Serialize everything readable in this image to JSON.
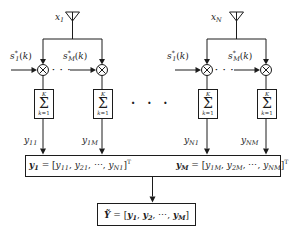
{
  "palette": {
    "ink": "#1c1c1c",
    "paper": "#ffffff"
  },
  "icons": {
    "antenna": "triangle-on-pole",
    "multiplier": "circled-times ⊗",
    "summation": "Σ block"
  },
  "ellipsis": {
    "dots": "···"
  },
  "labels": {
    "x1": [
      {
        "t": "x",
        "f": "i"
      },
      {
        "t": "1",
        "pos": "s",
        "f": "i"
      }
    ],
    "xN": [
      {
        "t": "x",
        "f": "i"
      },
      {
        "t": "N",
        "pos": "s",
        "f": "i"
      }
    ],
    "s1": [
      {
        "t": "s",
        "f": "i"
      },
      {
        "t": "*",
        "pos": "u",
        "f": "n"
      },
      {
        "t": "1",
        "pos": "s",
        "f": "i"
      },
      {
        "t": "(",
        "f": "n"
      },
      {
        "t": "k",
        "f": "i"
      },
      {
        "t": ")",
        "f": "n"
      }
    ],
    "sM": [
      {
        "t": "s",
        "f": "i"
      },
      {
        "t": "*",
        "pos": "u",
        "f": "n"
      },
      {
        "t": "M",
        "pos": "s",
        "f": "i"
      },
      {
        "t": "(",
        "f": "n"
      },
      {
        "t": "k",
        "f": "i"
      },
      {
        "t": ")",
        "f": "n"
      }
    ]
  },
  "sum_block": {
    "upper": [
      {
        "t": "K",
        "f": "i"
      }
    ],
    "symbol": [
      {
        "t": "Σ",
        "f": "n"
      }
    ],
    "lower": [
      {
        "t": "k",
        "f": "i"
      },
      {
        "t": "=1",
        "f": "n"
      }
    ]
  },
  "outputs": {
    "y11": [
      {
        "t": "y",
        "f": "i"
      },
      {
        "t": "11",
        "pos": "s",
        "f": "i"
      }
    ],
    "y1M": [
      {
        "t": "y",
        "f": "i"
      },
      {
        "t": "1M",
        "pos": "s",
        "f": "i"
      }
    ],
    "yN1": [
      {
        "t": "y",
        "f": "i"
      },
      {
        "t": "N1",
        "pos": "s",
        "f": "i"
      }
    ],
    "yNM": [
      {
        "t": "y",
        "f": "i"
      },
      {
        "t": "NM",
        "pos": "s",
        "f": "i"
      }
    ]
  },
  "vectors": {
    "y1": [
      {
        "t": "y",
        "f": "b"
      },
      {
        "t": "1",
        "pos": "s",
        "f": "b"
      },
      {
        "t": " = [",
        "f": "n"
      },
      {
        "t": "y",
        "f": "i"
      },
      {
        "t": "11",
        "pos": "s",
        "f": "i"
      },
      {
        "t": ", ",
        "f": "n"
      },
      {
        "t": "y",
        "f": "i"
      },
      {
        "t": "21",
        "pos": "s",
        "f": "i"
      },
      {
        "t": ", ",
        "f": "n"
      },
      {
        "t": "⋯",
        "f": "n"
      },
      {
        "t": ", ",
        "f": "n"
      },
      {
        "t": "y",
        "f": "i"
      },
      {
        "t": "N1",
        "pos": "s",
        "f": "i"
      },
      {
        "t": "]",
        "f": "n"
      },
      {
        "t": "T",
        "pos": "u",
        "f": "n"
      }
    ],
    "yM": [
      {
        "t": "y",
        "f": "b"
      },
      {
        "t": "M",
        "pos": "s",
        "f": "b"
      },
      {
        "t": " = [",
        "f": "n"
      },
      {
        "t": "y",
        "f": "i"
      },
      {
        "t": "1M",
        "pos": "s",
        "f": "i"
      },
      {
        "t": ", ",
        "f": "n"
      },
      {
        "t": "y",
        "f": "i"
      },
      {
        "t": "2M",
        "pos": "s",
        "f": "i"
      },
      {
        "t": ", ",
        "f": "n"
      },
      {
        "t": "⋯",
        "f": "n"
      },
      {
        "t": ", ",
        "f": "n"
      },
      {
        "t": "y",
        "f": "i"
      },
      {
        "t": "NM",
        "pos": "s",
        "f": "i"
      },
      {
        "t": "]",
        "f": "n"
      },
      {
        "t": "T",
        "pos": "u",
        "f": "n"
      }
    ],
    "final": [
      {
        "t": "Ỹ",
        "f": "b"
      },
      {
        "t": " = [",
        "f": "n"
      },
      {
        "t": "y",
        "f": "b"
      },
      {
        "t": "1",
        "pos": "s",
        "f": "b"
      },
      {
        "t": ", ",
        "f": "n"
      },
      {
        "t": "y",
        "f": "b"
      },
      {
        "t": "2",
        "pos": "s",
        "f": "b"
      },
      {
        "t": ", ",
        "f": "n"
      },
      {
        "t": "⋯",
        "f": "n"
      },
      {
        "t": ", ",
        "f": "n"
      },
      {
        "t": "y",
        "f": "b"
      },
      {
        "t": "M",
        "pos": "s",
        "f": "b"
      },
      {
        "t": "]",
        "f": "n"
      }
    ]
  }
}
